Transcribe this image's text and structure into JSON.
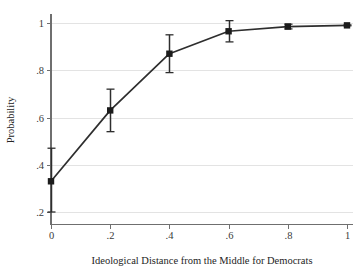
{
  "chart_data": {
    "type": "line",
    "title": "",
    "subtitle": "",
    "xlabel": "Ideological Distance from the Middle for Democrats",
    "ylabel": "Probability",
    "x": [
      0,
      0.2,
      0.4,
      0.6,
      0.8,
      1
    ],
    "xticklabels": [
      "0",
      ".2",
      ".4",
      ".6",
      ".8",
      "1"
    ],
    "yticklabels": [
      "1",
      ".8",
      ".6",
      ".4",
      ".2"
    ],
    "yticks": [
      1,
      0.8,
      0.6,
      0.4,
      0.2
    ],
    "xlim": [
      0,
      1
    ],
    "ylim": [
      0.175,
      1.03
    ],
    "grid": "horizontal",
    "legend": "none",
    "marker": "square",
    "series": [
      {
        "name": "Predicted probability",
        "values": [
          0.33,
          0.63,
          0.87,
          0.965,
          0.985,
          0.99
        ],
        "ci_low": [
          0.2,
          0.54,
          0.79,
          0.92,
          0.975,
          0.988
        ],
        "ci_high": [
          0.47,
          0.72,
          0.95,
          1.01,
          0.995,
          0.992
        ]
      }
    ],
    "colors": {
      "line": "#2e2e2e",
      "marker": "#1c1c1c",
      "grid": "#e3e3e3",
      "axis": "#6f6f6f",
      "background": "#ffffff"
    }
  }
}
